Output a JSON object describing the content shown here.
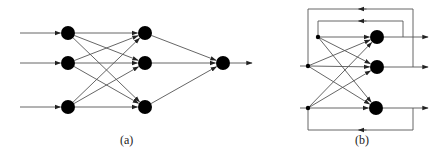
{
  "colors": {
    "background": "#ffffff",
    "node": "#000000",
    "edge": "#555555",
    "label": "#222222"
  },
  "diagrams": [
    {
      "id": "a",
      "label": "(a)",
      "label_pos": [
        128,
        144
      ],
      "kind": "feedforward",
      "node_radius": 7,
      "layers": [
        {
          "name": "input",
          "nodes": [
            [
              68,
              33
            ],
            [
              68,
              63
            ],
            [
              68,
              107
            ]
          ]
        },
        {
          "name": "hidden",
          "nodes": [
            [
              145,
              33
            ],
            [
              145,
              63
            ],
            [
              145,
              107
            ]
          ]
        },
        {
          "name": "output",
          "nodes": [
            [
              223,
              63
            ]
          ]
        }
      ],
      "input_stubs_start_x": 20,
      "output_stub_end_x": 252
    },
    {
      "id": "b",
      "label": "(b)",
      "label_pos": [
        363,
        144
      ],
      "kind": "recurrent",
      "node_radius": 7,
      "input_points": [
        [
          318,
          37
        ],
        [
          308,
          66
        ],
        [
          308,
          108
        ]
      ],
      "nodes": [
        [
          377,
          37
        ],
        [
          377,
          67
        ],
        [
          376,
          108
        ]
      ],
      "input_stub_start_x": 300,
      "output_stub_end_x": 428,
      "feedback_loops": [
        {
          "name": "outer-top",
          "points": [
            [
              413,
              67
            ],
            [
              413,
              9
            ],
            [
              308,
              9
            ],
            [
              308,
              66
            ]
          ]
        },
        {
          "name": "inner-top",
          "points": [
            [
              403,
              37
            ],
            [
              403,
              21
            ],
            [
              318,
              21
            ],
            [
              318,
              37
            ]
          ]
        },
        {
          "name": "bottom",
          "points": [
            [
              413,
              108
            ],
            [
              413,
              130
            ],
            [
              308,
              130
            ],
            [
              308,
              108
            ]
          ]
        }
      ]
    }
  ]
}
